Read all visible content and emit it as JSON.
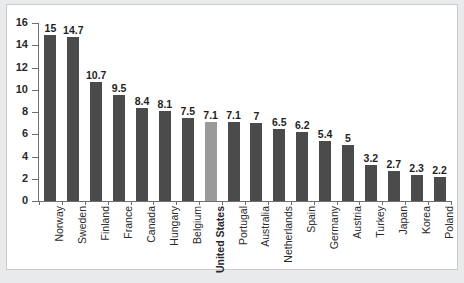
{
  "chart_data": {
    "type": "bar",
    "title": "",
    "subtitle": "",
    "xlabel": "",
    "ylabel": "",
    "ylim": [
      0,
      16
    ],
    "yticks": [
      0,
      2,
      4,
      6,
      8,
      10,
      12,
      14,
      16
    ],
    "ytick_labels": [
      "0",
      "2",
      "4",
      "6",
      "8",
      "10",
      "12",
      "14",
      "16"
    ],
    "grid": false,
    "legend": false,
    "legend_position": "none",
    "highlight_category": "United States",
    "colors": {
      "bar": "#4b4b4b",
      "highlight_bar": "#9a9a9a",
      "axis": "#6d6f72",
      "text": "#1f1f1f",
      "plot_background": "#ffffff",
      "page_background": "#e9eaec",
      "frame_border": "#c9cbcd"
    },
    "categories": [
      "Norway",
      "Sweden",
      "Finland",
      "France",
      "Canada",
      "Hungary",
      "Belgium",
      "United States",
      "Portugal",
      "Australia",
      "Netherlands",
      "Spain",
      "Germany",
      "Austria",
      "Turkey",
      "Japan",
      "Korea",
      "Poland"
    ],
    "values": [
      15,
      14.7,
      10.7,
      9.5,
      8.4,
      8.1,
      7.5,
      7.1,
      7.1,
      7,
      6.5,
      6.2,
      5.4,
      5,
      3.2,
      2.7,
      2.3,
      2.2
    ],
    "value_labels": [
      "15",
      "14.7",
      "10.7",
      "9.5",
      "8.4",
      "8.1",
      "7.5",
      "7.1",
      "7.1",
      "7",
      "6.5",
      "6.2",
      "5.4",
      "5",
      "3.2",
      "2.7",
      "2.3",
      "2.2"
    ]
  }
}
